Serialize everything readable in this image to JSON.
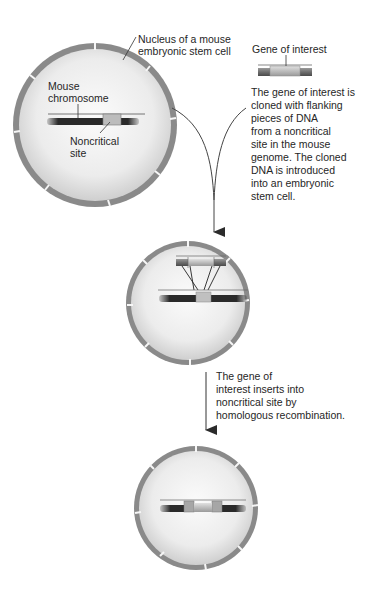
{
  "labels": {
    "nucleus": "Nucleus of a mouse\nembryonic stem cell",
    "mouse_chromosome": "Mouse\nchromosome",
    "noncritical_site": "Noncritical\nsite",
    "gene_of_interest": "Gene of interest",
    "step1_caption": "The gene of interest is\ncloned with flanking\npieces of DNA\nfrom a noncritical\nsite in the mouse\ngenome.  The cloned\nDNA is introduced\ninto an embryonic\nstem cell.",
    "step2_caption": "The gene of\ninterest inserts into\nnoncritical site by\nhomologous recombination."
  },
  "colors": {
    "nucleus_rim": "#8a8a8a",
    "nucleus_fill": "#f2f2f2",
    "chromosome_dark": "#2e2e2e",
    "gene_light": "#c8c8c8",
    "arrow": "#333333"
  }
}
